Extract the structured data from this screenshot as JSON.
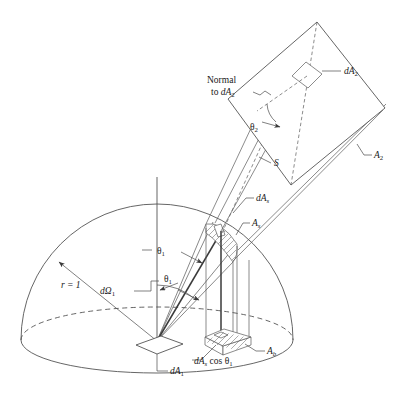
{
  "figure": {
    "domain": "diagram",
    "kind": "radiative-heat-transfer-view-factor-geometry",
    "title": "",
    "background_color": "#ffffff",
    "line_color": "#4a4a4a",
    "text_color": "#1a1a1a"
  },
  "labels": {
    "normal_line1": "Normal",
    "normal_line2_prefix": "to ",
    "normal_line2_sym": "dA",
    "normal_line2_sub": "2",
    "dA2_sym": "dA",
    "dA2_sub": "2",
    "theta2_sym": "θ",
    "theta2_sub": "2",
    "A2_sym": "A",
    "A2_sub": "2",
    "S_sym": "S",
    "dAs_sym": "dA",
    "dAs_sub": "s",
    "As_sym": "A",
    "As_sub": "s",
    "theta1_upper_sym": "θ",
    "theta1_upper_sub": "1",
    "theta1_lower_sym": "θ",
    "theta1_lower_sub": "1",
    "r_label": "r = 1",
    "dOmega1_sym": "dΩ",
    "dOmega1_sub": "1",
    "dA1_sym": "dA",
    "dA1_sub": "1",
    "Ab_sym": "A",
    "Ab_sub": "b",
    "dAscos_prefix": "dA",
    "dAscos_sub": "s",
    "dAscos_mid": " cos ",
    "dAscos_theta": "θ",
    "dAscos_theta_sub": "1"
  },
  "geometry": {
    "hemisphere": {
      "center_x": 157,
      "center_y": 340,
      "radius_x": 136,
      "radius_y": 136,
      "base_ellipse_ry": 33,
      "radius_value": "r = 1"
    },
    "axis": {
      "x": 157,
      "y_top": 177,
      "y_bottom": 340
    },
    "patch_dA1": {
      "cx": 157,
      "cy": 347
    },
    "patch_As": {
      "cx": 222,
      "cy": 232
    },
    "patch_Ab": {
      "cx": 224,
      "cy": 340
    },
    "surface_A2": {
      "apex_x": 317,
      "apex_y": 22,
      "right_x": 385,
      "right_y": 108
    },
    "patch_dA2": {
      "cx": 307,
      "cy": 74
    }
  }
}
